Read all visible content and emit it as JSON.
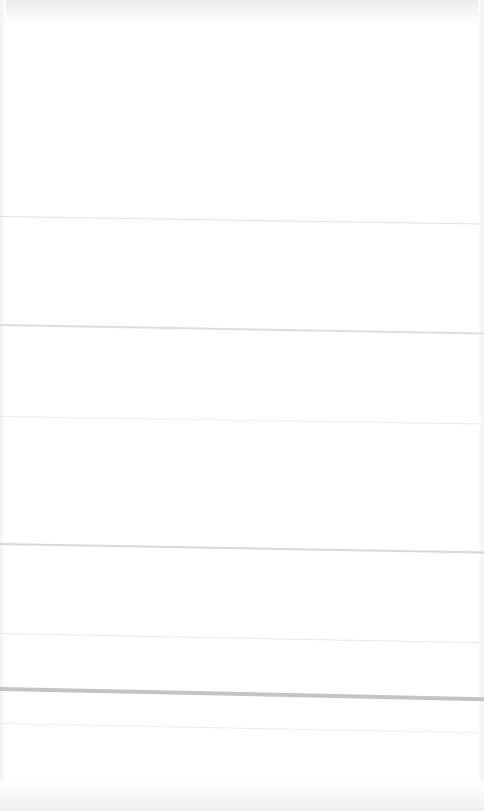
{
  "page": {
    "background": "#ffffff",
    "top_band_color": "#ececec",
    "note_visible_text": ""
  },
  "dividers": [
    {
      "y": 216,
      "tilt_deg": 0.9,
      "thickness": 1,
      "color": "#e2e2e2"
    },
    {
      "y": 324,
      "tilt_deg": 1.0,
      "thickness": 2,
      "color": "#dedede"
    },
    {
      "y": 416,
      "tilt_deg": 0.9,
      "thickness": 1,
      "color": "#ececec"
    },
    {
      "y": 543,
      "tilt_deg": 1.0,
      "thickness": 2,
      "color": "#d9d9d9"
    },
    {
      "y": 633,
      "tilt_deg": 1.1,
      "thickness": 1,
      "color": "#e8e8e8"
    },
    {
      "y": 687,
      "tilt_deg": 1.2,
      "thickness": 4,
      "color": "#c4c4c4"
    },
    {
      "y": 723,
      "tilt_deg": 1.1,
      "thickness": 1,
      "color": "#ededed"
    }
  ],
  "sections": [
    {
      "top": 22,
      "height": 194
    },
    {
      "top": 218,
      "height": 106
    },
    {
      "top": 326,
      "height": 90
    },
    {
      "top": 418,
      "height": 125
    },
    {
      "top": 545,
      "height": 88
    },
    {
      "top": 635,
      "height": 52
    },
    {
      "top": 691,
      "height": 32
    },
    {
      "top": 725,
      "height": 86
    }
  ]
}
